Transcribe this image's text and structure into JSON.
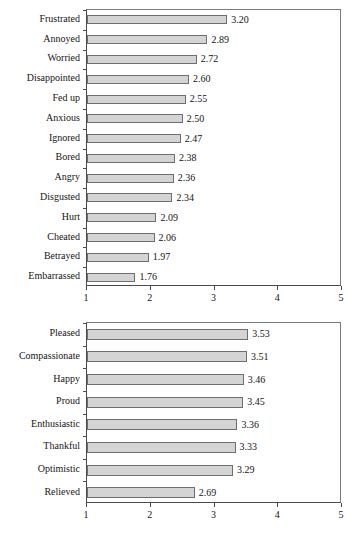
{
  "figure": {
    "background_color": "#ffffff",
    "bar_fill_color": "#d4d4d4",
    "bar_border_color": "#6e6e6e",
    "axis_color": "#4a4a4a",
    "text_color": "#141414"
  },
  "chart_data": [
    {
      "id": "negative-emotions",
      "type": "bar",
      "orientation": "horizontal",
      "title": "",
      "subtitle": "",
      "xlabel": "",
      "ylabel": "",
      "xlim": [
        1,
        5
      ],
      "xticks": [
        "1",
        "2",
        "3",
        "4",
        "5"
      ],
      "xtick_values": [
        1,
        2,
        3,
        4,
        5
      ],
      "grid": false,
      "legend": null,
      "categories": [
        "Frustrated",
        "Annoyed",
        "Worried",
        "Disappointed",
        "Fed up",
        "Anxious",
        "Ignored",
        "Bored",
        "Angry",
        "Disgusted",
        "Hurt",
        "Cheated",
        "Betrayed",
        "Embarrassed"
      ],
      "values": [
        3.2,
        2.89,
        2.72,
        2.6,
        2.55,
        2.5,
        2.47,
        2.38,
        2.36,
        2.34,
        2.09,
        2.06,
        1.97,
        1.76
      ],
      "data_labels": [
        "3.20",
        "2.89",
        "2.72",
        "2.60",
        "2.55",
        "2.50",
        "2.47",
        "2.38",
        "2.36",
        "2.34",
        "2.09",
        "2.06",
        "1.97",
        "1.76"
      ]
    },
    {
      "id": "positive-emotions",
      "type": "bar",
      "orientation": "horizontal",
      "title": "",
      "subtitle": "",
      "xlabel": "",
      "ylabel": "",
      "xlim": [
        1,
        5
      ],
      "xticks": [
        "1",
        "2",
        "3",
        "4",
        "5"
      ],
      "xtick_values": [
        1,
        2,
        3,
        4,
        5
      ],
      "grid": false,
      "legend": null,
      "categories": [
        "Pleased",
        "Compassionate",
        "Happy",
        "Proud",
        "Enthusiastic",
        "Thankful",
        "Optimistic",
        "Relieved"
      ],
      "values": [
        3.53,
        3.51,
        3.46,
        3.45,
        3.36,
        3.33,
        3.29,
        2.69
      ],
      "data_labels": [
        "3.53",
        "3.51",
        "3.46",
        "3.45",
        "3.36",
        "3.33",
        "3.29",
        "2.69"
      ]
    }
  ]
}
